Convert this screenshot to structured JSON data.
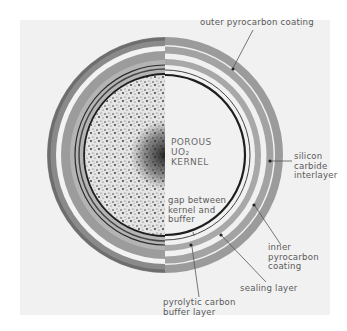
{
  "diagram": {
    "type": "cross-section of coated nuclear fuel particle",
    "kernel_label": {
      "line1": "POROUS",
      "line2": "UO₂",
      "line3": "KERNEL"
    },
    "labels": {
      "outer_pyrocarbon": "outer pyrocarbon coating",
      "silicon_carbide": [
        "silicon",
        "carbide",
        "interlayer"
      ],
      "gap": [
        "gap between",
        "kernel and",
        "buffer"
      ],
      "inner_pyrocarbon": [
        "inner",
        "pyrocarbon",
        "coating"
      ],
      "sealing_layer": "sealing layer",
      "buffer_layer": [
        "pyrolytic carbon",
        "buffer layer"
      ]
    },
    "colors": {
      "background": "#f1f1f1",
      "ring_gray": "#9a9a9a",
      "kernel_edge": "#1e1e1e",
      "text": "#5a5a5a"
    }
  }
}
